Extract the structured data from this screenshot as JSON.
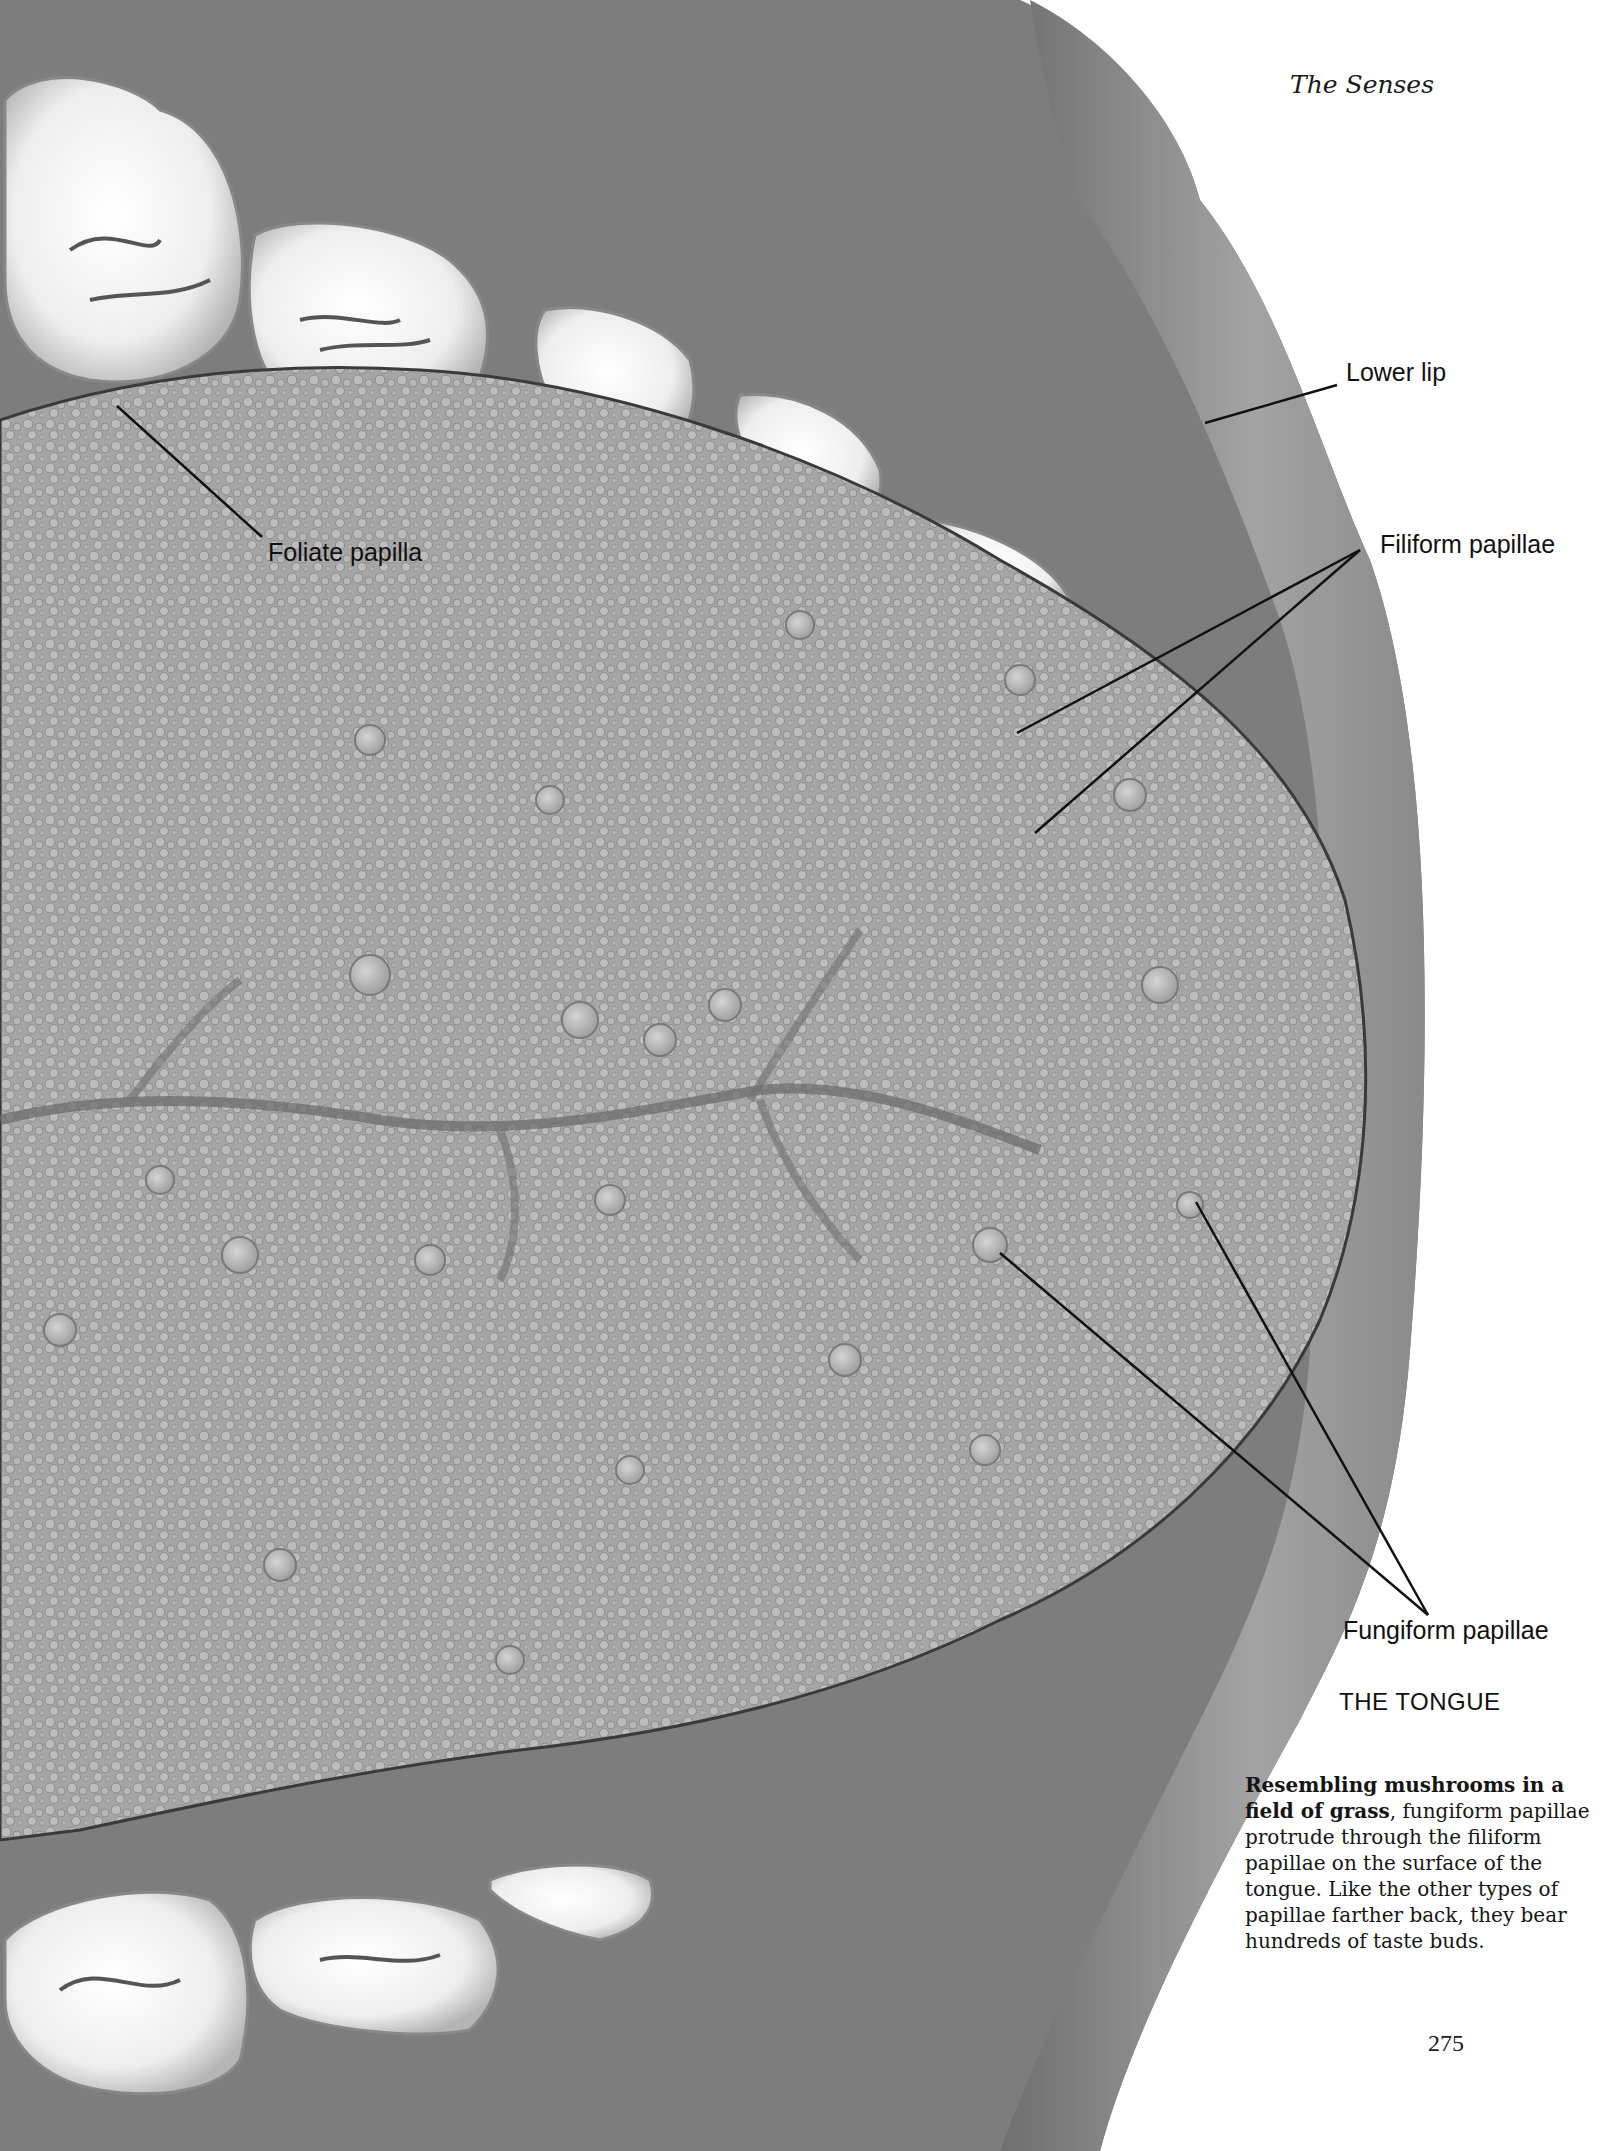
{
  "page": {
    "running_head": "The Senses",
    "page_number": "275"
  },
  "figure": {
    "title": "THE TONGUE",
    "labels": {
      "lower_lip": "Lower lip",
      "filiform_papillae": "Filiform papillae",
      "foliate_papilla": "Foliate papilla",
      "fungiform_papillae": "Fungiform papillae"
    },
    "colors": {
      "background": "#ffffff",
      "oral_cavity": "#7a7a7a",
      "lip": "#9a9a9a",
      "tongue": "#a9a9a9",
      "teeth": "#f2f2f2",
      "leader_line": "#111111"
    }
  },
  "caption": {
    "lead_bold": "Resembling mushrooms in a field of grass",
    "body": ", fungiform papillae protrude through the filiform papillae on the surface of the tongue. Like the other types of papillae farther back, they bear hundreds of taste buds."
  }
}
